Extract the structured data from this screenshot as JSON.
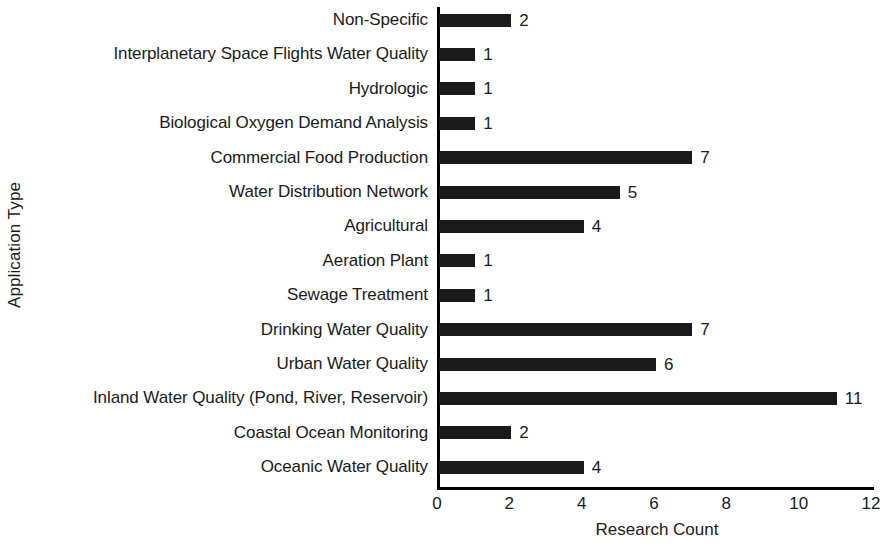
{
  "chart_data": {
    "type": "bar",
    "orientation": "horizontal",
    "title": "",
    "xlabel": "Research Count",
    "ylabel": "Application Type",
    "xlim": [
      0,
      12
    ],
    "xticks": [
      0,
      2,
      4,
      6,
      8,
      10,
      12
    ],
    "grid": false,
    "legend": null,
    "bar_color": "#1a1a1a",
    "background_color": "#ffffff",
    "show_value_labels": true,
    "categories": [
      "Non-Specific",
      "Interplanetary Space Flights Water Quality",
      "Hydrologic",
      "Biological Oxygen Demand Analysis",
      "Commercial Food Production",
      "Water Distribution Network",
      "Agricultural",
      "Aeration Plant",
      "Sewage Treatment",
      "Drinking Water Quality",
      "Urban Water Quality",
      "Inland Water Quality (Pond, River, Reservoir)",
      "Coastal Ocean Monitoring",
      "Oceanic Water Quality"
    ],
    "values": [
      2,
      1,
      1,
      1,
      7,
      5,
      4,
      1,
      1,
      7,
      6,
      11,
      2,
      4
    ],
    "value_labels": [
      "2",
      "1",
      "1",
      "1",
      "7",
      "5",
      "4",
      "1",
      "1",
      "7",
      "6",
      "11",
      "2",
      "4"
    ],
    "xtick_labels": [
      "0",
      "2",
      "4",
      "6",
      "8",
      "10",
      "12"
    ]
  }
}
